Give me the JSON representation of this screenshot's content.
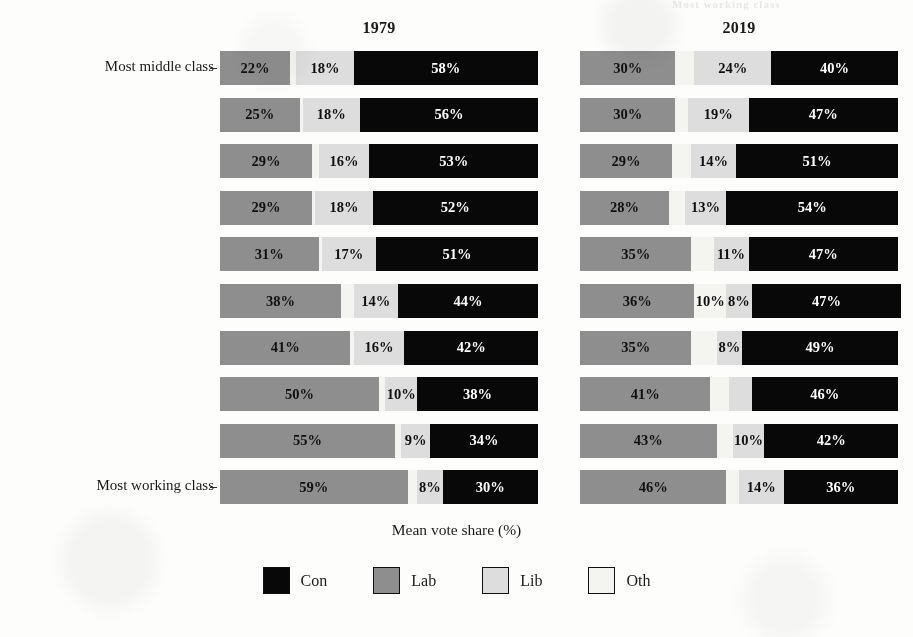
{
  "axis": {
    "x_title": "Mean vote share (%)",
    "top_label": "Most middle class",
    "bottom_label": "Most working class"
  },
  "panels": [
    {
      "title": "1979"
    },
    {
      "title": "2019"
    }
  ],
  "bleed_text": "Most working class",
  "legend": {
    "items": [
      {
        "label": "Con",
        "color": "#080808"
      },
      {
        "label": "Lab",
        "color": "#8e8e8e"
      },
      {
        "label": "Lib",
        "color": "#dddddd"
      },
      {
        "label": "Oth",
        "color": "#f4f4f1"
      }
    ]
  },
  "chart_data": {
    "type": "bar",
    "orientation": "horizontal",
    "stacked": true,
    "title": "",
    "xlabel": "Mean vote share (%)",
    "ylabel": "",
    "xlim": [
      0,
      100
    ],
    "grid": false,
    "legend_position": "bottom",
    "facets": [
      "1979",
      "2019"
    ],
    "categories": [
      "Most middle class",
      "decile 2",
      "decile 3",
      "decile 4",
      "decile 5",
      "decile 6",
      "decile 7",
      "decile 8",
      "decile 9",
      "Most working class"
    ],
    "series_order": [
      "Lab",
      "Oth",
      "Lib",
      "Con"
    ],
    "panel_1979": {
      "rows": [
        {
          "lab": 22,
          "oth": 2,
          "lib": 18,
          "con": 58,
          "labels": {
            "lab": "22%",
            "oth": "",
            "lib": "18%",
            "con": "58%"
          }
        },
        {
          "lab": 25,
          "oth": 1,
          "lib": 18,
          "con": 56,
          "labels": {
            "lab": "25%",
            "oth": "",
            "lib": "18%",
            "con": "56%"
          }
        },
        {
          "lab": 29,
          "oth": 2,
          "lib": 16,
          "con": 53,
          "labels": {
            "lab": "29%",
            "oth": "",
            "lib": "16%",
            "con": "53%"
          }
        },
        {
          "lab": 29,
          "oth": 1,
          "lib": 18,
          "con": 52,
          "labels": {
            "lab": "29%",
            "oth": "",
            "lib": "18%",
            "con": "52%"
          }
        },
        {
          "lab": 31,
          "oth": 1,
          "lib": 17,
          "con": 51,
          "labels": {
            "lab": "31%",
            "oth": "",
            "lib": "17%",
            "con": "51%"
          }
        },
        {
          "lab": 38,
          "oth": 4,
          "lib": 14,
          "con": 44,
          "labels": {
            "lab": "38%",
            "oth": "",
            "lib": "14%",
            "con": "44%"
          }
        },
        {
          "lab": 41,
          "oth": 1,
          "lib": 16,
          "con": 42,
          "labels": {
            "lab": "41%",
            "oth": "",
            "lib": "16%",
            "con": "42%"
          }
        },
        {
          "lab": 50,
          "oth": 2,
          "lib": 10,
          "con": 38,
          "labels": {
            "lab": "50%",
            "oth": "",
            "lib": "10%",
            "con": "38%"
          }
        },
        {
          "lab": 55,
          "oth": 2,
          "lib": 9,
          "con": 34,
          "labels": {
            "lab": "55%",
            "oth": "",
            "lib": "9%",
            "con": "34%"
          }
        },
        {
          "lab": 59,
          "oth": 3,
          "lib": 8,
          "con": 30,
          "labels": {
            "lab": "59%",
            "oth": "",
            "lib": "8%",
            "con": "30%"
          }
        }
      ]
    },
    "panel_2019": {
      "rows": [
        {
          "lab": 30,
          "oth": 6,
          "lib": 24,
          "con": 40,
          "labels": {
            "lab": "30%",
            "oth": "",
            "lib": "24%",
            "con": "40%"
          }
        },
        {
          "lab": 30,
          "oth": 4,
          "lib": 19,
          "con": 47,
          "labels": {
            "lab": "30%",
            "oth": "",
            "lib": "19%",
            "con": "47%"
          }
        },
        {
          "lab": 29,
          "oth": 6,
          "lib": 14,
          "con": 51,
          "labels": {
            "lab": "29%",
            "oth": "",
            "lib": "14%",
            "con": "51%"
          }
        },
        {
          "lab": 28,
          "oth": 5,
          "lib": 13,
          "con": 54,
          "labels": {
            "lab": "28%",
            "oth": "",
            "lib": "13%",
            "con": "54%"
          }
        },
        {
          "lab": 35,
          "oth": 7,
          "lib": 11,
          "con": 47,
          "labels": {
            "lab": "35%",
            "oth": "",
            "lib": "11%",
            "con": "47%"
          }
        },
        {
          "lab": 36,
          "oth": 10,
          "lib": 8,
          "con": 47,
          "labels": {
            "lab": "36%",
            "oth": "10%",
            "lib": "8%",
            "con": "47%"
          }
        },
        {
          "lab": 35,
          "oth": 8,
          "lib": 8,
          "con": 49,
          "labels": {
            "lab": "35%",
            "oth": "",
            "lib": "8%",
            "con": "49%"
          }
        },
        {
          "lab": 41,
          "oth": 6,
          "lib": 7,
          "con": 46,
          "labels": {
            "lab": "41%",
            "oth": "",
            "lib": "",
            "con": "46%"
          }
        },
        {
          "lab": 43,
          "oth": 5,
          "lib": 10,
          "con": 42,
          "labels": {
            "lab": "43%",
            "oth": "",
            "lib": "10%",
            "con": "42%"
          }
        },
        {
          "lab": 46,
          "oth": 4,
          "lib": 14,
          "con": 36,
          "labels": {
            "lab": "46%",
            "oth": "",
            "lib": "14%",
            "con": "36%"
          }
        }
      ]
    }
  }
}
